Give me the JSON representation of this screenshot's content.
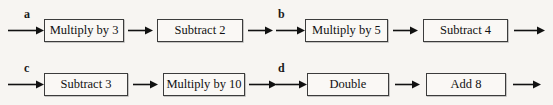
{
  "figure": {
    "background_color": "#f7f5f2",
    "box_border_color": "#3c3c3c",
    "box_fill_color": "#faf8f5",
    "arrow_color": "#111111",
    "text_color": "#111111"
  },
  "panels": [
    {
      "label": "a",
      "steps": [
        "Multiply by 3",
        "Subtract 2"
      ]
    },
    {
      "label": "b",
      "steps": [
        "Multiply by 5",
        "Subtract 4"
      ]
    },
    {
      "label": "c",
      "steps": [
        "Subtract 3",
        "Multiply by 10"
      ]
    },
    {
      "label": "d",
      "steps": [
        "Double",
        "Add 8"
      ]
    }
  ]
}
